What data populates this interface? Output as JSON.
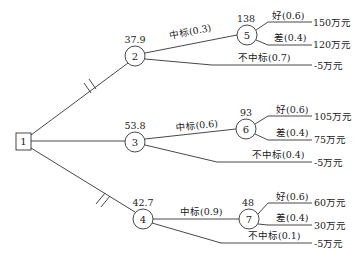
{
  "diagram": {
    "type": "decision-tree",
    "decision_node": {
      "id": "1"
    },
    "alternatives": [
      {
        "chance_node": "2",
        "expected_value": "37.9",
        "pruned": true,
        "win_label": "中标(0.3)",
        "lose_label": "不中标(0.7)",
        "lose_payoff": "-5万元",
        "sub_node": "5",
        "sub_expected_value": "138",
        "good_label": "好(0.6)",
        "good_payoff": "150万元",
        "bad_label": "差(0.4)",
        "bad_payoff": "120万元"
      },
      {
        "chance_node": "3",
        "expected_value": "53.8",
        "pruned": false,
        "win_label": "中标(0.6)",
        "lose_label": "不中标(0.4)",
        "lose_payoff": "-5万元",
        "sub_node": "6",
        "sub_expected_value": "93",
        "good_label": "好(0.6)",
        "good_payoff": "105万元",
        "bad_label": "差(0.4)",
        "bad_payoff": "75万元"
      },
      {
        "chance_node": "4",
        "expected_value": "42.7",
        "pruned": true,
        "win_label": "中标(0.9)",
        "lose_label": "不中标(0.1)",
        "lose_payoff": "-5万元",
        "sub_node": "7",
        "sub_expected_value": "48",
        "good_label": "好(0.6)",
        "good_payoff": "60万元",
        "bad_label": "差(0.4)",
        "bad_payoff": "30万元"
      }
    ]
  }
}
